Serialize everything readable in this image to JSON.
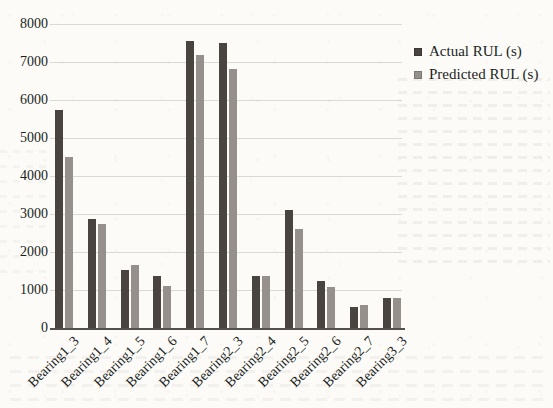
{
  "figure": {
    "background_color": "#fcfbf8",
    "text_color": "#211f1c",
    "axis_color": "#55504c",
    "gridline_color": "rgba(150,146,140,0.32)"
  },
  "chart_data": {
    "type": "bar",
    "title": "",
    "xlabel": "",
    "ylabel": "",
    "categories": [
      "Bearing1_3",
      "Bearing1_4",
      "Bearing1_5",
      "Bearing1_6",
      "Bearing1_7",
      "Bearing2_3",
      "Bearing2_4",
      "Bearing2_5",
      "Bearing2_6",
      "Bearing2_7",
      "Bearing3_3"
    ],
    "series": [
      {
        "name": "Actual RUL (s)",
        "color": "#4a4441",
        "values": [
          5730,
          2880,
          1540,
          1370,
          7560,
          7500,
          1380,
          3110,
          1250,
          550,
          800
        ]
      },
      {
        "name": "Predicted RUL (s)",
        "color": "#95908b",
        "values": [
          4510,
          2730,
          1650,
          1100,
          7180,
          6820,
          1380,
          2600,
          1090,
          610,
          780
        ]
      }
    ],
    "ylim": [
      0,
      8000
    ],
    "yticks": [
      0,
      1000,
      2000,
      3000,
      4000,
      5000,
      6000,
      7000,
      8000
    ],
    "grid": "horizontal-faint",
    "legend_position": "upper-right",
    "x_tick_rotation_deg": 45
  }
}
